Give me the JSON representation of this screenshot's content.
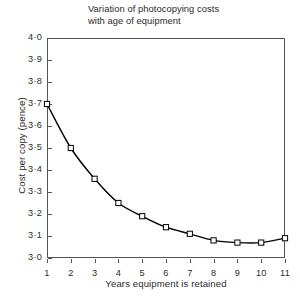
{
  "chart_data": {
    "type": "line",
    "title": "Variation of photocopying costs\nwith age of equipment",
    "xlabel": "Years equipment is retained",
    "ylabel": "Cost per copy (pence)",
    "x": [
      1,
      2,
      3,
      4,
      5,
      6,
      7,
      8,
      9,
      10,
      11
    ],
    "values": [
      3.7,
      3.5,
      3.36,
      3.25,
      3.19,
      3.14,
      3.11,
      3.08,
      3.07,
      3.07,
      3.09
    ],
    "series": [
      {
        "name": "Cost per copy",
        "values": [
          3.7,
          3.5,
          3.36,
          3.25,
          3.19,
          3.14,
          3.11,
          3.08,
          3.07,
          3.07,
          3.09
        ]
      }
    ],
    "xlim": [
      1,
      11
    ],
    "ylim": [
      3.0,
      4.0
    ],
    "xticks": [
      "1",
      "2",
      "3",
      "4",
      "5",
      "6",
      "7",
      "8",
      "9",
      "10",
      "11"
    ],
    "yticks": [
      "3·0",
      "3·1",
      "3·2",
      "3·3",
      "3·4",
      "3·5",
      "3·6",
      "3·7",
      "3·8",
      "3·9",
      "4·0"
    ],
    "ytick_values": [
      3.0,
      3.1,
      3.2,
      3.3,
      3.4,
      3.5,
      3.6,
      3.7,
      3.8,
      3.9,
      4.0
    ],
    "grid": false,
    "legend": null,
    "marker": "open-square",
    "line_color": "#000000",
    "marker_face_color": "#ffffff",
    "marker_edge_color": "#000000",
    "axis_color": "#555555",
    "background_color": "#ffffff"
  }
}
